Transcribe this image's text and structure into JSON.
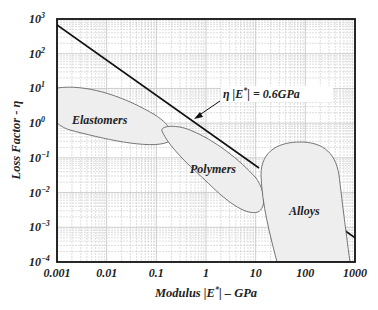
{
  "chart_data": {
    "type": "area",
    "title": "",
    "xlabel": "Modulus |E*| – GPa",
    "ylabel": "Loss Factor - η",
    "xscale": "log",
    "yscale": "log",
    "xlim": [
      0.001,
      1000
    ],
    "ylim": [
      0.0001,
      1000
    ],
    "grid": true,
    "x_ticks": [
      "0.001",
      "0.01",
      "0.1",
      "1",
      "10",
      "100",
      "1000"
    ],
    "y_ticks": [
      {
        "base": "10",
        "exp": "3"
      },
      {
        "base": "10",
        "exp": "2"
      },
      {
        "base": "10",
        "exp": "1"
      },
      {
        "base": "10",
        "exp": "0"
      },
      {
        "base": "10",
        "exp": "−1"
      },
      {
        "base": "10",
        "exp": "−2"
      },
      {
        "base": "10",
        "exp": "−3"
      },
      {
        "base": "10",
        "exp": "−4"
      }
    ],
    "series": [
      {
        "name": "Elastomers",
        "type": "region",
        "modulus_range_GPa": [
          0.001,
          0.2
        ],
        "loss_factor_range": [
          0.03,
          6
        ]
      },
      {
        "name": "Polymers",
        "type": "region",
        "modulus_range_GPa": [
          0.1,
          15
        ],
        "loss_factor_range": [
          0.003,
          0.5
        ]
      },
      {
        "name": "Alloys",
        "type": "region",
        "modulus_range_GPa": [
          12,
          1000
        ],
        "loss_factor_range": [
          0.0001,
          0.3
        ]
      },
      {
        "name": "η|E*| = 0.6GPa",
        "type": "line",
        "x": [
          0.001,
          12
        ],
        "y": [
          600,
          0.05
        ]
      }
    ],
    "annotations": [
      {
        "text": "η |E*| = 0.6GPa",
        "points_to": "constant line η|E*| = 0.6 GPa"
      }
    ]
  },
  "labels": {
    "xaxis_prefix": "Modulus |E",
    "xaxis_sup": "*",
    "xaxis_suffix": "| – GPa",
    "yaxis": "Loss Factor - η",
    "annot_prefix": "η |E",
    "annot_sup": "*",
    "annot_suffix": "| = 0.6GPa",
    "elastomers": "Elastomers",
    "polymers": "Polymers",
    "alloys": "Alloys"
  },
  "colors": {
    "region_fill": "#eeeeee",
    "grid": "#c8c8c8",
    "axis": "#111111"
  }
}
